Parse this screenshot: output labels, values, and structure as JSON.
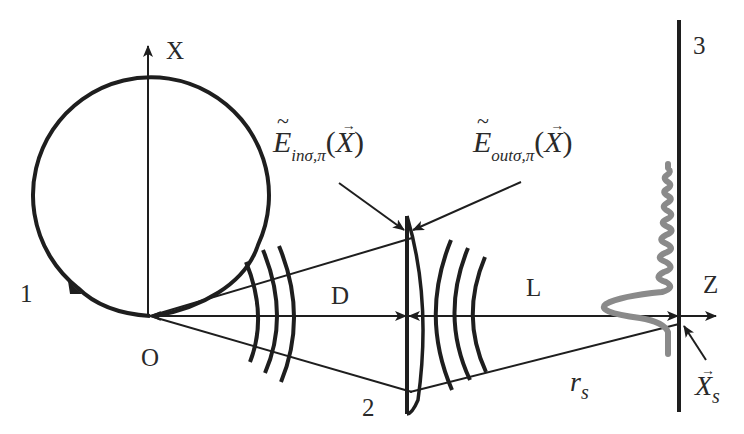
{
  "diagram": {
    "labels": {
      "x_axis": "X",
      "z_axis": "Z",
      "origin": "O",
      "orbit_number": "1",
      "lens_number": "2",
      "screen_number": "3",
      "distance_source_lens": "D",
      "distance_lens_screen": "L",
      "field_in": {
        "base": "E",
        "subscript": "inσ,π",
        "argument": "X"
      },
      "field_out": {
        "base": "E",
        "subscript": "outσ,π",
        "argument": "X"
      },
      "r_s": {
        "base": "r",
        "subscript": "s"
      },
      "x_s": {
        "base": "X",
        "subscript": "s"
      }
    },
    "colors": {
      "line": "#1e1e1e",
      "wave_profile": "#8a8a8a",
      "text": "#2a2a2a",
      "background": "#ffffff"
    }
  }
}
